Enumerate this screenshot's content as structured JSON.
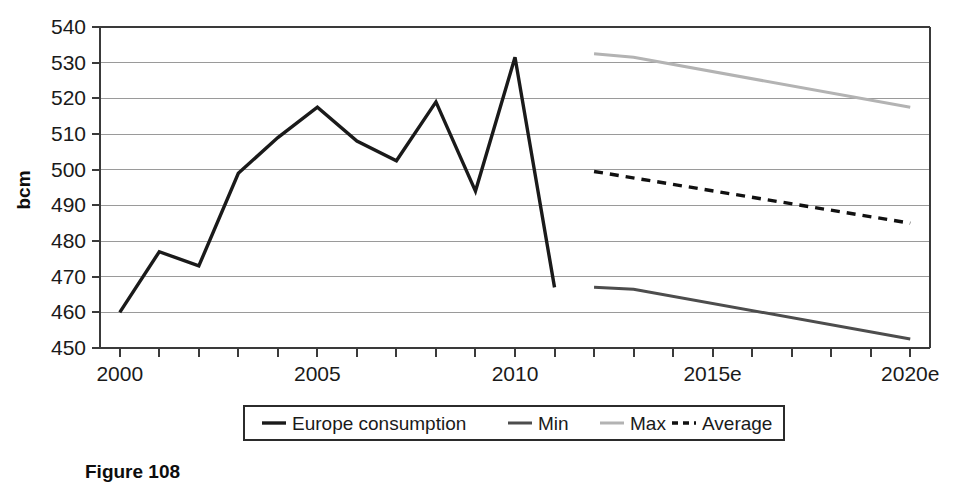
{
  "figure": {
    "caption": "Figure 108"
  },
  "chart_data": {
    "type": "line",
    "title": "",
    "xlabel": "",
    "ylabel": "bcm",
    "ylim": [
      450,
      540
    ],
    "xlim": [
      1999.5,
      2020.5
    ],
    "ytick_labels": [
      "450",
      "460",
      "470",
      "480",
      "490",
      "500",
      "510",
      "520",
      "530",
      "540"
    ],
    "yticks": [
      450,
      460,
      470,
      480,
      490,
      500,
      510,
      520,
      530,
      540
    ],
    "xtick_labels": [
      "2000",
      "2005",
      "2010",
      "2015e",
      "2020e"
    ],
    "xticks": [
      2000,
      2005,
      2010,
      2015,
      2020
    ],
    "grid": true,
    "legend_position": "bottom",
    "series": [
      {
        "name": "Europe consumption",
        "style": "solid",
        "color": "#1a1a1a",
        "width": 3.4,
        "x": [
          2000,
          2001,
          2002,
          2003,
          2004,
          2005,
          2006,
          2007,
          2008,
          2009,
          2010,
          2011
        ],
        "values": [
          460,
          477,
          473,
          499,
          509,
          517.5,
          508,
          502.5,
          519,
          494,
          531.5,
          467
        ]
      },
      {
        "name": "Min",
        "style": "solid",
        "color": "#4d4d4d",
        "width": 3.0,
        "x": [
          2012,
          2013,
          2020
        ],
        "values": [
          467,
          466.5,
          452.5
        ]
      },
      {
        "name": "Max",
        "style": "solid",
        "color": "#b3b3b3",
        "width": 3.0,
        "x": [
          2012,
          2013,
          2020
        ],
        "values": [
          532.5,
          531.5,
          517.5
        ]
      },
      {
        "name": "Average",
        "style": "dashed",
        "color": "#111111",
        "width": 3.4,
        "x": [
          2012,
          2020
        ],
        "values": [
          499.5,
          485
        ]
      }
    ]
  },
  "legend": {
    "items": [
      {
        "label": "Europe consumption",
        "swatch": "solid-black-thick"
      },
      {
        "label": "Min",
        "swatch": "solid-darkgray"
      },
      {
        "label": "Max",
        "swatch": "solid-lightgray"
      },
      {
        "label": "Average",
        "swatch": "dashed-black"
      }
    ]
  }
}
